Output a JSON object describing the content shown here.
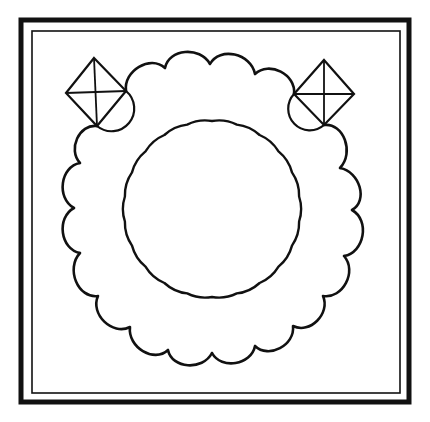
{
  "diagram": {
    "type": "line-art ornament",
    "background": "#ffffff",
    "ink": "#111111",
    "frame": {
      "outer": {
        "x": 21,
        "y": 20,
        "width": 388,
        "height": 382,
        "stroke_width": 5
      },
      "inner": {
        "x": 32,
        "y": 31,
        "width": 368,
        "height": 362,
        "stroke_width": 1.6
      }
    },
    "diamonds": [
      {
        "name": "left",
        "top": [
          94,
          58
        ],
        "left": [
          66,
          93
        ],
        "right": [
          126,
          91
        ],
        "bottom": [
          97,
          126
        ],
        "arc_side": "right-bottom"
      },
      {
        "name": "right",
        "top": [
          324,
          60
        ],
        "left": [
          294,
          94
        ],
        "right": [
          354,
          94
        ],
        "bottom": [
          324,
          125
        ],
        "arc_side": "left-bottom"
      }
    ],
    "outer_scalloped_ring": {
      "cusps": [
        [
          126,
          91
        ],
        [
          165,
          68
        ],
        [
          210,
          64
        ],
        [
          255,
          74
        ],
        [
          294,
          94
        ],
        [
          324,
          125
        ],
        [
          340,
          168
        ],
        [
          352,
          210
        ],
        [
          344,
          256
        ],
        [
          323,
          296
        ],
        [
          293,
          326
        ],
        [
          255,
          346
        ],
        [
          212,
          353
        ],
        [
          168,
          350
        ],
        [
          130,
          327
        ],
        [
          98,
          296
        ],
        [
          80,
          253
        ],
        [
          74,
          208
        ],
        [
          80,
          163
        ],
        [
          97,
          126
        ]
      ]
    },
    "inner_ring": {
      "center": [
        212,
        209
      ],
      "radius": 88,
      "cusp_count": 22
    }
  }
}
